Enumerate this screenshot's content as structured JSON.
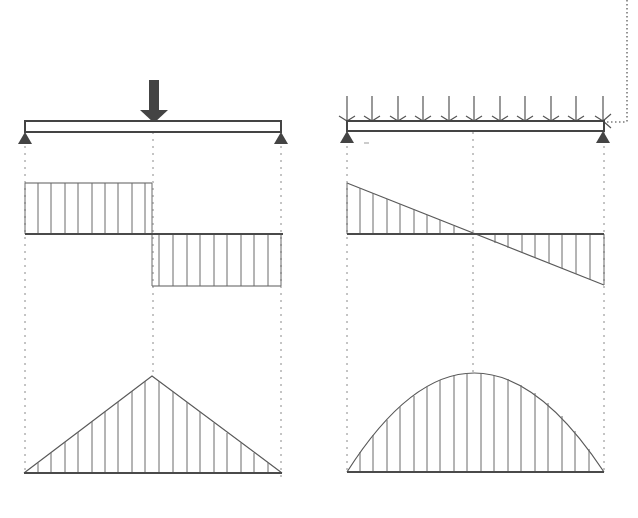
{
  "diagram": {
    "title": "",
    "panels": [
      {
        "id": "point-load",
        "load_type": "concentrated point load at midspan",
        "beam": {
          "x1": 25,
          "x2": 281,
          "top": 121,
          "bottom": 132
        },
        "load": {
          "x": 154,
          "shaft_top": 80,
          "tip": 122
        },
        "shear": {
          "axis_y": 234,
          "positive_y": 183,
          "negative_y": 286,
          "shape": "rectangular step"
        },
        "moment": {
          "axis_y": 473,
          "peak": [
            152,
            376
          ],
          "shape": "triangle"
        }
      },
      {
        "id": "distributed-load",
        "load_type": "uniformly distributed load",
        "beam": {
          "x1": 347,
          "x2": 604,
          "top": 121,
          "bottom": 131
        },
        "load": {
          "arrow_count": 11,
          "arrow_top": 96,
          "tip": 121
        },
        "shear": {
          "axis_y": 234,
          "start": [
            347,
            183
          ],
          "end": [
            604,
            285
          ],
          "zero_x": 473,
          "shape": "linear"
        },
        "moment": {
          "axis_y": 472,
          "peak": [
            473,
            373
          ],
          "shape": "parabola"
        }
      }
    ],
    "icons": [
      "point-load-arrow-icon",
      "distributed-load-arrow-icon",
      "pin-support-icon"
    ],
    "colors": {
      "ink": "#555555",
      "support": "#444444",
      "background": "#ffffff"
    }
  }
}
